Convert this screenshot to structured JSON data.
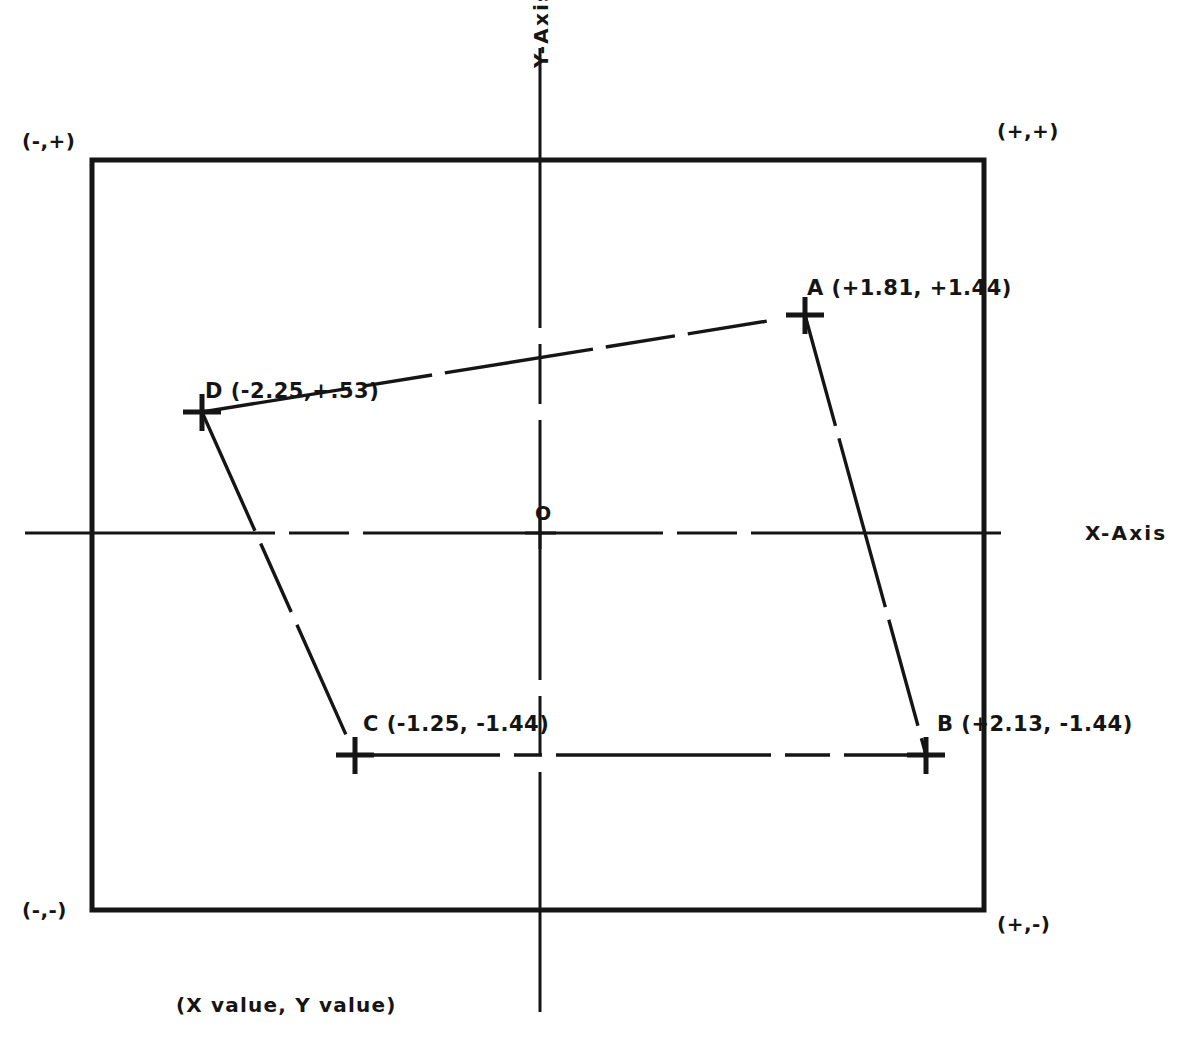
{
  "diagram": {
    "caption": "(X value, Y value)",
    "axes": {
      "x_label": "X-Axis",
      "y_label": "Y-Axis",
      "origin_label": "O"
    },
    "quadrant_labels": {
      "top_left": "(-,+)",
      "top_right": "(+,+)",
      "bottom_left": "(-,-)",
      "bottom_right": "(+,-)"
    },
    "points": [
      {
        "name": "A",
        "label": "A (+1.81, +1.44)",
        "x": 1.81,
        "y": 1.44
      },
      {
        "name": "B",
        "label": "B (+2.13, -1.44)",
        "x": 2.13,
        "y": -1.44
      },
      {
        "name": "C",
        "label": "C (-1.25, -1.44)",
        "x": -1.25,
        "y": -1.44
      },
      {
        "name": "D",
        "label": "D (-2.25,+.53)",
        "x": -2.25,
        "y": 0.53
      }
    ],
    "segments": [
      {
        "from": "D",
        "to": "A",
        "style": "dashed"
      },
      {
        "from": "A",
        "to": "B",
        "style": "dashed"
      },
      {
        "from": "C",
        "to": "B",
        "style": "dashed"
      },
      {
        "from": "D",
        "to": "C",
        "style": "dashed"
      }
    ],
    "colors": {
      "ink": "#151515",
      "background": "#ffffff"
    }
  }
}
